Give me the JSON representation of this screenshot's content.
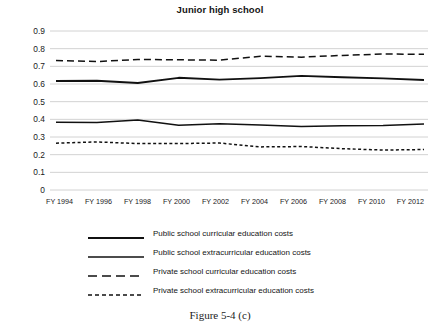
{
  "chart_data": {
    "type": "line",
    "title": "Junior high school",
    "xlabel": "",
    "ylabel": "",
    "ylim": [
      0,
      0.9
    ],
    "grid": true,
    "legend_position": "bottom",
    "categories": [
      "FY 1994",
      "FY 1996",
      "FY 1998",
      "FY 2000",
      "FY 2002",
      "FY 2004",
      "FY 2006",
      "FY 2008",
      "FY 2010",
      "FY 2012"
    ],
    "y_ticks": [
      "0",
      "0.1",
      "0.2",
      "0.3",
      "0.4",
      "0.5",
      "0.6",
      "0.7",
      "0.8",
      "0.9"
    ],
    "y_tick_values": [
      0,
      0.1,
      0.2,
      0.3,
      0.4,
      0.5,
      0.6,
      0.7,
      0.8,
      0.9
    ],
    "series": [
      {
        "name": "Public school curricular education costs",
        "style": "solid-thick",
        "values": [
          0.617,
          0.618,
          0.606,
          0.635,
          0.625,
          0.633,
          0.646,
          0.638,
          0.632,
          0.623
        ]
      },
      {
        "name": "Public school extracurricular education costs",
        "style": "solid",
        "values": [
          0.383,
          0.382,
          0.396,
          0.366,
          0.375,
          0.368,
          0.36,
          0.364,
          0.365,
          0.373
        ]
      },
      {
        "name": "Private school curricular education costs",
        "style": "dashed",
        "values": [
          0.733,
          0.727,
          0.739,
          0.737,
          0.735,
          0.757,
          0.752,
          0.762,
          0.77,
          0.768
        ]
      },
      {
        "name": "Private school extracurricular education costs",
        "style": "dotted",
        "values": [
          0.265,
          0.272,
          0.263,
          0.263,
          0.266,
          0.244,
          0.246,
          0.234,
          0.226,
          0.229
        ]
      }
    ],
    "colors": {
      "line": "#111111",
      "gridline": "#d2d2d2",
      "text": "#1a1a1a",
      "background": "#ffffff"
    }
  },
  "legend": {
    "items": [
      {
        "label": "Public school curricular education costs",
        "style": "solid-thick"
      },
      {
        "label": "Public school extracurricular education costs",
        "style": "solid"
      },
      {
        "label": "Private school curricular education costs",
        "style": "dashed"
      },
      {
        "label": "Private school extracurricular education costs",
        "style": "dotted"
      }
    ]
  },
  "caption": {
    "text": "Figure 5-4 (c)"
  }
}
